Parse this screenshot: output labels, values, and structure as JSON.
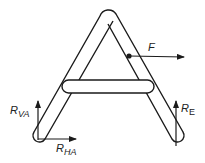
{
  "diagram": {
    "colors": {
      "stroke": "#1a1a1a",
      "background": "#ffffff"
    },
    "members": [
      {
        "id": "left-leg",
        "label": "Left leg"
      },
      {
        "id": "right-leg",
        "label": "Right leg"
      },
      {
        "id": "crossbar",
        "label": "Crossbar"
      }
    ],
    "forces": {
      "applied": {
        "symbol": "F",
        "direction": "right"
      },
      "r_va": {
        "symbol": "R",
        "subscript": "VA",
        "direction": "up"
      },
      "r_ha": {
        "symbol": "R",
        "subscript": "HA",
        "direction": "right"
      },
      "r_e": {
        "symbol": "R",
        "subscript": "E",
        "direction": "up"
      }
    }
  }
}
